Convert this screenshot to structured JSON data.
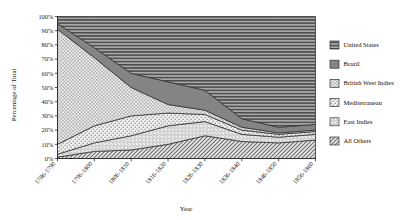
{
  "chart_data": {
    "type": "area",
    "title": "",
    "xlabel": "Year",
    "ylabel": "Percentage of Total",
    "stacked": true,
    "normalized": true,
    "grid": false,
    "legend_position": "right",
    "ylim": [
      0,
      100
    ],
    "ytick_labels": [
      "0%",
      "10%",
      "20%",
      "30%",
      "40%",
      "50%",
      "60%",
      "70%",
      "80%",
      "90%",
      "100%"
    ],
    "ytick_values": [
      0,
      10,
      20,
      30,
      40,
      50,
      60,
      70,
      80,
      90,
      100
    ],
    "categories": [
      "1786-1790",
      "1796-1800",
      "1806-1810",
      "1816-1820",
      "1826-1830",
      "1836-1840",
      "1846-1850",
      "1856-1860"
    ],
    "series": [
      {
        "name": "United States",
        "pattern": "horizontal-lines",
        "color": "#8d8d8d",
        "values": [
          5,
          22,
          40,
          46,
          52,
          72,
          78,
          76
        ]
      },
      {
        "name": "Brazil",
        "pattern": "solid-gray",
        "color": "#7a7a7a",
        "values": [
          4,
          7,
          10,
          16,
          14,
          6,
          4,
          4
        ]
      },
      {
        "name": "British West Indies",
        "pattern": "cross-hatch",
        "color": "#d8d8d8",
        "values": [
          81,
          48,
          20,
          6,
          3,
          2,
          1,
          1
        ]
      },
      {
        "name": "Mediterranean",
        "pattern": "dots",
        "color": "#e2e2e2",
        "values": [
          7,
          12,
          14,
          9,
          5,
          3,
          2,
          2
        ]
      },
      {
        "name": "East Indies",
        "pattern": "diagonal-thin",
        "color": "#c9c9c9",
        "values": [
          2,
          6,
          10,
          13,
          10,
          5,
          4,
          4
        ]
      },
      {
        "name": "All Others",
        "pattern": "diagonal-hatch",
        "color": "#bdbdbd",
        "values": [
          1,
          5,
          6,
          10,
          16,
          12,
          11,
          13
        ]
      }
    ],
    "legend_entries": [
      {
        "label": "United States",
        "swatch": "horizontal-lines"
      },
      {
        "label": "Brazil",
        "swatch": "solid-gray"
      },
      {
        "label": "British West Indies",
        "swatch": "cross-hatch"
      },
      {
        "label": "Mediterranean",
        "swatch": "dots"
      },
      {
        "label": "East Indies",
        "swatch": "diagonal-thin"
      },
      {
        "label": "All Others",
        "swatch": "diagonal-hatch"
      }
    ]
  },
  "colors": {
    "axis": "#2b2b2b",
    "background": "#ffffff",
    "text": "#1a1a1a"
  }
}
